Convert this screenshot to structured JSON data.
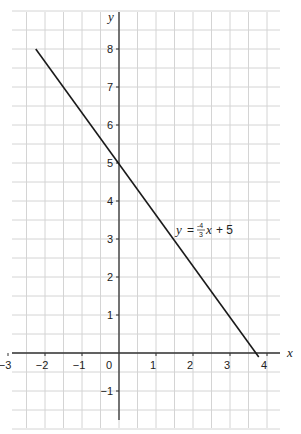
{
  "chart_data": {
    "type": "line",
    "title": "",
    "xlabel": "x",
    "ylabel": "y",
    "xlim": [
      -3,
      4
    ],
    "ylim": [
      -2,
      9
    ],
    "x_ticks": [
      "-3",
      "-2",
      "-1",
      "0",
      "1",
      "2",
      "3",
      "4"
    ],
    "y_ticks": [
      "-1",
      "1",
      "2",
      "3",
      "4",
      "5",
      "6",
      "7",
      "8"
    ],
    "grid": true,
    "grid_minor_step": 0.5,
    "series": [
      {
        "name": "y = -4/3 x + 5",
        "equation": "y = -4/3x + 5",
        "slope": -1.3333,
        "intercept": 5,
        "x": [
          -2.25,
          3.75
        ],
        "y": [
          8,
          0
        ]
      }
    ],
    "annotations": [
      {
        "text": "y = -4/3 x + 5",
        "x": 1.5,
        "y": 3.2
      }
    ]
  },
  "labels": {
    "x_axis": "x",
    "y_axis": "y",
    "equation_y": "y",
    "equation_eq": "=",
    "equation_num": "-4",
    "equation_den": "3",
    "equation_x": "x",
    "equation_rest": "+ 5"
  },
  "colors": {
    "grid": "#d4d4d4",
    "axis": "#333333",
    "line": "#1a1a1a"
  }
}
